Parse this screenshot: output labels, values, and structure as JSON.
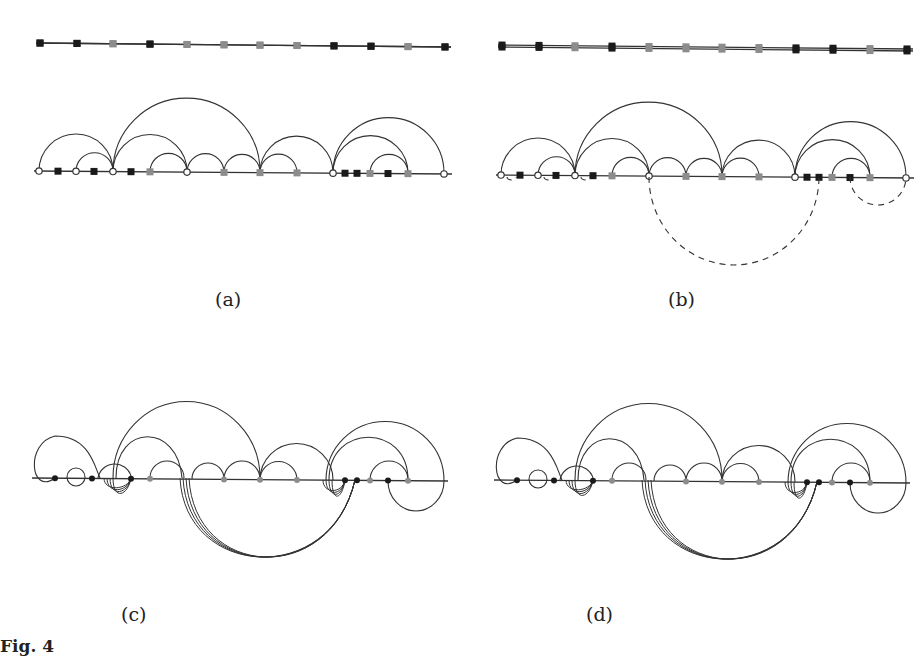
{
  "figure": {
    "caption_fragment": "Fig. 4",
    "panels": [
      {
        "id": "a",
        "label": "(a)",
        "offset_x": 0,
        "offset_y": 0,
        "bottom_dashed": false
      },
      {
        "id": "b",
        "label": "(b)",
        "offset_x": 438,
        "offset_y": 4,
        "bottom_dashed": true
      },
      {
        "id": "c",
        "label": "(c)",
        "offset_x": 0,
        "offset_y": 307,
        "bottom_dashed": false
      },
      {
        "id": "d",
        "label": "(d)",
        "offset_x": 438,
        "offset_y": 309,
        "bottom_dashed": false
      }
    ],
    "colors": {
      "line": "#333333",
      "dark_node": "#1a1a1a",
      "grey_node": "#8c8c8c",
      "open_node_fill": "#ffffff"
    },
    "top_sequence": [
      "B",
      "B",
      "G",
      "B",
      "G",
      "G",
      "G",
      "G",
      "B",
      "B",
      "G",
      "B"
    ]
  }
}
